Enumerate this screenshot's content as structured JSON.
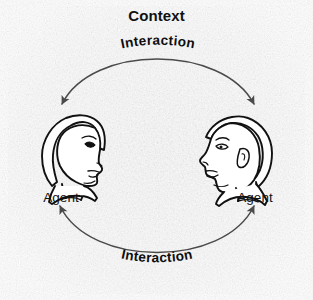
{
  "figure": {
    "kind": "concept-diagram",
    "title": "Context",
    "background_color": "#fdfdfd",
    "ink_color": "#111111",
    "arc_color": "#4a4a4a"
  },
  "context_panel": {
    "label": "Context"
  },
  "agents": [
    {
      "id": "agent-left",
      "label": "Agent",
      "icon": "head-profile-female-facing-right",
      "position": "left"
    },
    {
      "id": "agent-right",
      "label": "Agent",
      "icon": "head-profile-male-facing-left",
      "position": "right"
    }
  ],
  "arcs": [
    {
      "id": "arc-top",
      "label": "Interaction",
      "direction": "bidirectional",
      "arrowheads": [
        "left-end",
        "right-end"
      ],
      "position": "top"
    },
    {
      "id": "arc-bottom",
      "label": "Interaction",
      "direction": "bidirectional",
      "arrowheads": [
        "left-end",
        "right-end"
      ],
      "position": "bottom"
    }
  ],
  "labels": {
    "interaction_top": "Interaction",
    "interaction_bottom": "Interaction",
    "agent_left": "Agent",
    "agent_right": "Agent"
  }
}
